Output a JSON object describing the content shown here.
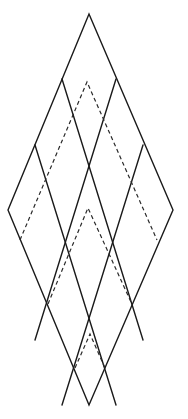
{
  "diagram": {
    "type": "rhombus-grid-with-dashed-chevrons",
    "canvas": {
      "width": 188,
      "height": 419
    },
    "colors": {
      "stroke": "#1a1a1a",
      "dashed": "#2a2a2a",
      "background": "#ffffff"
    },
    "outline": {
      "top": [
        89,
        14
      ],
      "right": [
        173,
        210
      ],
      "bottom": [
        89,
        405
      ],
      "left": [
        8,
        210
      ]
    },
    "grid": {
      "divisions": 3,
      "lines": [
        {
          "from": [
            62,
            79
          ],
          "to": [
            143,
            340
          ]
        },
        {
          "from": [
            35,
            145
          ],
          "to": [
            116,
            405
          ]
        },
        {
          "from": [
            116,
            79
          ],
          "to": [
            35,
            340
          ]
        },
        {
          "from": [
            143,
            145
          ],
          "to": [
            62,
            405
          ]
        }
      ]
    },
    "dashed_chevrons": [
      {
        "name": "upper",
        "apex": [
          87,
          82
        ],
        "left_end": [
          20,
          240
        ],
        "right_end": [
          157,
          240
        ]
      },
      {
        "name": "middle",
        "apex": [
          88,
          208
        ],
        "left_end": [
          48,
          304
        ],
        "right_end": [
          131,
          302
        ]
      },
      {
        "name": "lower",
        "apex": [
          90,
          334
        ],
        "left_end": [
          75,
          368
        ],
        "right_end": [
          105,
          368
        ]
      }
    ]
  }
}
